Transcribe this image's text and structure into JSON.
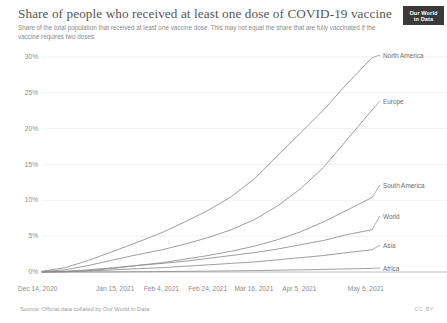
{
  "header": {
    "title": "Share of people who received at least one dose of COVID-19 vaccine",
    "subtitle": "Share of the total population that received at least one vaccine dose. This may not equal the share that are fully vaccinated if the vaccine requires two doses.",
    "logo_line1": "Our World",
    "logo_line2": "in Data"
  },
  "footer": {
    "source": "Source: Official data collated by Our World in Data",
    "license": "CC BY"
  },
  "colors": {
    "line": "#8c8c8c",
    "grid": "#ededed",
    "axis": "#b8b8b8",
    "text": "#8d8d8d",
    "title": "#555555",
    "logo_bg": "#3a3a3a"
  },
  "chart_data": {
    "type": "line",
    "title": "Share of people who received at least one dose of COVID-19 vaccine",
    "subtitle": "Share of the total population that received at least one vaccine dose. This may not equal the share that are fully vaccinated if the vaccine requires two doses.",
    "xlabel": "",
    "ylabel": "",
    "grid": true,
    "legend_position": "right-inline-labels",
    "ylim": [
      0,
      30
    ],
    "yticks": [
      0,
      5,
      10,
      15,
      20,
      25,
      30
    ],
    "ytick_labels": [
      "0%",
      "5%",
      "10%",
      "15%",
      "20%",
      "25%",
      "30%"
    ],
    "xtick_labels": [
      "Dec 14, 2020",
      "Jan 15, 2021",
      "Feb 4, 2021",
      "Feb 24, 2021",
      "Mar 16, 2021",
      "Apr 5, 2021",
      "May 6, 2021"
    ],
    "xtick_days": [
      0,
      32,
      52,
      72,
      92,
      112,
      143
    ],
    "x_range_days": [
      0,
      143
    ],
    "x": [
      0,
      10,
      20,
      31,
      41,
      52,
      62,
      72,
      82,
      92,
      102,
      112,
      122,
      132,
      143
    ],
    "series": [
      {
        "name": "North America",
        "values": [
          0.1,
          0.6,
          1.6,
          2.9,
          4.1,
          5.5,
          7.0,
          8.6,
          10.5,
          13.0,
          16.2,
          19.4,
          22.6,
          26.2,
          29.9
        ]
      },
      {
        "name": "Europe",
        "values": [
          0.05,
          0.3,
          0.9,
          1.7,
          2.4,
          3.1,
          3.9,
          4.8,
          5.9,
          7.3,
          9.2,
          11.6,
          14.6,
          18.4,
          22.6
        ]
      },
      {
        "name": "South America",
        "values": [
          0.0,
          0.05,
          0.2,
          0.5,
          0.9,
          1.3,
          1.8,
          2.3,
          2.9,
          3.6,
          4.5,
          5.6,
          7.0,
          8.6,
          10.4
        ]
      },
      {
        "name": "World",
        "values": [
          0.02,
          0.1,
          0.3,
          0.6,
          0.9,
          1.2,
          1.5,
          1.9,
          2.3,
          2.7,
          3.2,
          3.8,
          4.4,
          5.2,
          5.9
        ]
      },
      {
        "name": "Asia",
        "values": [
          0.0,
          0.05,
          0.15,
          0.3,
          0.45,
          0.6,
          0.8,
          1.0,
          1.2,
          1.4,
          1.7,
          2.0,
          2.3,
          2.7,
          3.1
        ]
      },
      {
        "name": "Africa",
        "values": [
          0.0,
          0.0,
          0.01,
          0.02,
          0.04,
          0.06,
          0.09,
          0.12,
          0.16,
          0.2,
          0.25,
          0.3,
          0.36,
          0.43,
          0.5
        ]
      }
    ]
  }
}
